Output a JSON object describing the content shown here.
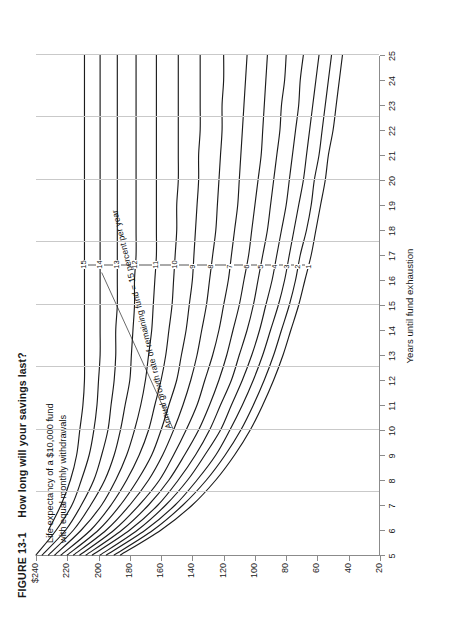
{
  "figure": {
    "number": "FIGURE 13-1",
    "title": "How long will your savings last?",
    "subtitle": "Life expectancy of a $10,000 fund\nwith equal monthly withdrawals",
    "annotation": "Annual growth rate of remaining fund = 15 percent per year"
  },
  "chart_data": {
    "type": "line",
    "title": "How long will your savings last?",
    "subtitle": "Life expectancy of a $10,000 fund with equal monthly withdrawals",
    "xlabel": "Years until fund exhaustion",
    "ylabel": "Withdrawal amount per month",
    "xlim": [
      5,
      25
    ],
    "ylim": [
      20,
      240
    ],
    "xticks": [
      5,
      6,
      7,
      8,
      9,
      10,
      11,
      12,
      13,
      14,
      15,
      16,
      17,
      18,
      19,
      20,
      21,
      22,
      23,
      24,
      25
    ],
    "xticklabels": [
      "5",
      "6",
      "7",
      "8",
      "9",
      "10",
      "11",
      "12",
      "13",
      "14",
      "15",
      "16",
      "17",
      "18",
      "19",
      "20",
      "21",
      "22",
      "23",
      "24",
      "25"
    ],
    "yticks": [
      240,
      220,
      200,
      180,
      160,
      140,
      120,
      100,
      80,
      60,
      40,
      20
    ],
    "yticklabels": [
      "$240",
      "220",
      "200",
      "180",
      "160",
      "140",
      "120",
      "100",
      "80",
      "60",
      "40",
      "20"
    ],
    "y_axis_inverted": true,
    "grid": "vertical",
    "gridlines_x": [
      5,
      7.5,
      10,
      12.5,
      15,
      17.5,
      20,
      22.5,
      25
    ],
    "legend_position": "inline-curve-labels",
    "series_unit": "percent per year",
    "annotation": "Annual growth rate of remaining fund = 15 percent per year",
    "series": [
      {
        "name": "1",
        "label": "1",
        "x": [
          5,
          6,
          7,
          8,
          9,
          10,
          11,
          12,
          13,
          14,
          15,
          16,
          17,
          18,
          19,
          20,
          21,
          22,
          23,
          24,
          25
        ],
        "values": [
          186,
          160,
          140,
          125,
          113,
          103,
          95,
          88,
          82,
          77,
          72,
          68,
          64,
          61,
          58,
          55,
          53,
          50,
          48,
          46,
          44
        ]
      },
      {
        "name": "2",
        "label": "2",
        "x": [
          5,
          6,
          7,
          8,
          9,
          10,
          11,
          12,
          13,
          14,
          15,
          16,
          17,
          18,
          19,
          20,
          21,
          22,
          23,
          24,
          25
        ],
        "values": [
          190,
          165,
          146,
          131,
          119,
          109,
          101,
          94,
          88,
          83,
          78,
          74,
          71,
          67,
          64,
          62,
          59,
          57,
          55,
          53,
          51
        ]
      },
      {
        "name": "3",
        "label": "3",
        "x": [
          5,
          6,
          7,
          8,
          9,
          10,
          11,
          12,
          13,
          14,
          15,
          16,
          17,
          18,
          19,
          20,
          21,
          22,
          23,
          24,
          25
        ],
        "values": [
          195,
          170,
          151,
          137,
          125,
          116,
          108,
          101,
          95,
          90,
          85,
          81,
          78,
          75,
          72,
          69,
          67,
          65,
          63,
          61,
          59
        ]
      },
      {
        "name": "4",
        "label": "4",
        "x": [
          5,
          6,
          7,
          8,
          9,
          10,
          11,
          12,
          13,
          14,
          15,
          16,
          17,
          18,
          19,
          20,
          21,
          22,
          23,
          24,
          25
        ],
        "values": [
          199,
          175,
          157,
          143,
          132,
          122,
          115,
          108,
          102,
          97,
          93,
          89,
          86,
          83,
          80,
          78,
          76,
          74,
          72,
          71,
          69
        ]
      },
      {
        "name": "5",
        "label": "5",
        "x": [
          5,
          6,
          7,
          8,
          9,
          10,
          11,
          12,
          13,
          14,
          15,
          16,
          17,
          18,
          19,
          20,
          21,
          22,
          23,
          24,
          25
        ],
        "values": [
          204,
          180,
          162,
          149,
          138,
          129,
          122,
          115,
          110,
          105,
          101,
          98,
          95,
          92,
          90,
          88,
          86,
          84,
          83,
          81,
          80
        ]
      },
      {
        "name": "6",
        "label": "6",
        "x": [
          5,
          6,
          7,
          8,
          9,
          10,
          11,
          12,
          13,
          14,
          15,
          16,
          17,
          18,
          19,
          20,
          21,
          22,
          23,
          24,
          25
        ],
        "values": [
          208,
          185,
          168,
          155,
          145,
          136,
          129,
          123,
          118,
          114,
          110,
          107,
          104,
          102,
          100,
          98,
          96,
          95,
          94,
          93,
          92
        ]
      },
      {
        "name": "7",
        "label": "7",
        "x": [
          5,
          6,
          7,
          8,
          9,
          10,
          11,
          12,
          13,
          14,
          15,
          16,
          17,
          18,
          19,
          20,
          21,
          22,
          23,
          24,
          25
        ],
        "values": [
          212,
          190,
          174,
          161,
          152,
          144,
          137,
          132,
          127,
          123,
          120,
          117,
          115,
          113,
          111,
          110,
          109,
          108,
          107,
          106,
          105
        ]
      },
      {
        "name": "8",
        "label": "8",
        "x": [
          5,
          6,
          7,
          8,
          9,
          10,
          11,
          12,
          13,
          14,
          15,
          16,
          17,
          18,
          19,
          20,
          21,
          22,
          23,
          24,
          25
        ],
        "values": [
          216,
          195,
          180,
          168,
          159,
          152,
          146,
          141,
          137,
          134,
          131,
          129,
          127,
          125,
          124,
          123,
          122,
          121,
          121,
          120,
          120
        ]
      },
      {
        "name": "9",
        "label": "9",
        "x": [
          5,
          6,
          7,
          8,
          9,
          10,
          11,
          12,
          13,
          14,
          15,
          16,
          17,
          18,
          19,
          20,
          21,
          22,
          23,
          24,
          25
        ],
        "values": [
          220,
          200,
          186,
          175,
          166,
          160,
          155,
          150,
          147,
          144,
          142,
          140,
          139,
          138,
          137,
          136,
          136,
          135,
          135,
          135,
          135
        ]
      },
      {
        "name": "10",
        "label": "10",
        "x": [
          5,
          6,
          7,
          8,
          9,
          10,
          11,
          12,
          13,
          14,
          15,
          16,
          17,
          18,
          19,
          20,
          21,
          22,
          23,
          24,
          25
        ],
        "values": [
          224,
          205,
          192,
          182,
          174,
          168,
          164,
          160,
          157,
          155,
          153,
          152,
          151,
          150,
          150,
          149,
          149,
          149,
          149,
          149,
          149
        ]
      },
      {
        "name": "11",
        "label": "11",
        "x": [
          5,
          6,
          7,
          8,
          9,
          10,
          11,
          12,
          13,
          14,
          15,
          16,
          17,
          18,
          19,
          20,
          21,
          22,
          23,
          24,
          25
        ],
        "values": [
          228,
          211,
          198,
          189,
          182,
          177,
          173,
          170,
          168,
          166,
          165,
          164,
          163,
          163,
          163,
          163,
          163,
          163,
          163,
          163,
          163
        ]
      },
      {
        "name": "12",
        "label": "12",
        "x": [
          5,
          6,
          7,
          8,
          9,
          10,
          11,
          12,
          13,
          14,
          15,
          16,
          17,
          18,
          19,
          20,
          21,
          22,
          23,
          24,
          25
        ],
        "values": [
          232,
          216,
          205,
          196,
          190,
          186,
          183,
          180,
          179,
          178,
          177,
          177,
          176,
          176,
          176,
          176,
          176,
          176,
          176,
          176,
          176
        ]
      },
      {
        "name": "13",
        "label": "13",
        "x": [
          5,
          6,
          7,
          8,
          9,
          10,
          11,
          12,
          13,
          14,
          15,
          16,
          17,
          18,
          19,
          20,
          21,
          22,
          23,
          24,
          25
        ],
        "values": [
          236,
          221,
          211,
          203,
          198,
          194,
          192,
          190,
          189,
          189,
          188,
          188,
          188,
          188,
          188,
          188,
          188,
          188,
          188,
          188,
          188
        ]
      },
      {
        "name": "14",
        "label": "14",
        "x": [
          5,
          6,
          7,
          8,
          9,
          10,
          11,
          12,
          13,
          14,
          15,
          16,
          17,
          18,
          19,
          20,
          21,
          22,
          23,
          24,
          25
        ],
        "values": [
          240,
          227,
          217,
          211,
          206,
          203,
          201,
          200,
          199,
          199,
          199,
          199,
          199,
          199,
          199,
          199,
          199,
          199,
          199,
          199,
          199
        ]
      },
      {
        "name": "15",
        "label": "15",
        "x": [
          5,
          6,
          7,
          8,
          9,
          10,
          11,
          12,
          13,
          14,
          15,
          16,
          17,
          18,
          19,
          20,
          21,
          22,
          23,
          24,
          25
        ],
        "values": [
          244,
          232,
          224,
          218,
          214,
          212,
          210,
          209,
          209,
          209,
          209,
          209,
          209,
          209,
          209,
          209,
          209,
          209,
          209,
          209,
          209
        ]
      }
    ]
  }
}
